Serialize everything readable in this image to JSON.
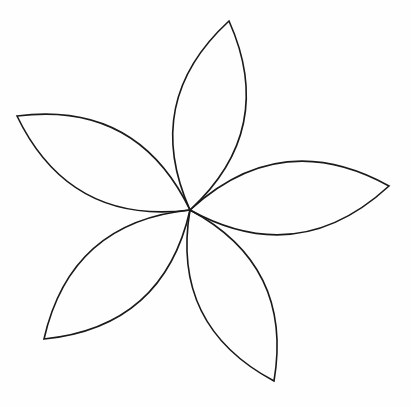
{
  "diagram": {
    "type": "flower-line-drawing",
    "petal_count": 5,
    "center": [
      190,
      210
    ],
    "stroke_color": "#1a1a1a",
    "background_color": "#fefefe",
    "petals": [
      {
        "name": "top",
        "tip": [
          229,
          21
        ]
      },
      {
        "name": "right",
        "tip": [
          389,
          186
        ]
      },
      {
        "name": "bottom",
        "tip": [
          274,
          381
        ]
      },
      {
        "name": "lower-left",
        "tip": [
          44,
          339
        ]
      },
      {
        "name": "upper-left",
        "tip": [
          17,
          116
        ]
      }
    ]
  }
}
